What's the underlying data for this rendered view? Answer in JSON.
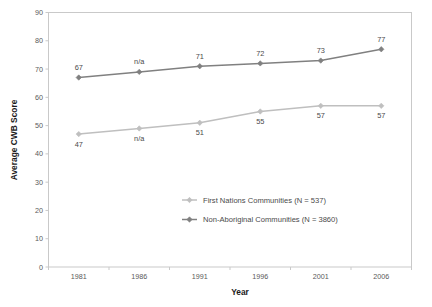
{
  "chart_data": {
    "type": "line",
    "title": "",
    "xlabel": "Year",
    "ylabel": "Average CWB Score",
    "x": [
      "1981",
      "1986",
      "1991",
      "1996",
      "2001",
      "2006"
    ],
    "categories": [
      "1981",
      "1986",
      "1991",
      "1996",
      "2001",
      "2006"
    ],
    "ylim": [
      0,
      90
    ],
    "yticks": [
      "0",
      "10",
      "20",
      "30",
      "40",
      "50",
      "60",
      "70",
      "80",
      "90"
    ],
    "grid": false,
    "legend_position": "inside-center-right",
    "series": [
      {
        "name": "First Nations Communities (N = 537)",
        "color": "#bfbfbf",
        "values": [
          47,
          49,
          51,
          55,
          57,
          57
        ],
        "labels": [
          "47",
          "n/a",
          "51",
          "55",
          "57",
          "57"
        ],
        "label_position": "below"
      },
      {
        "name": "Non-Aboriginal Communities (N = 3860)",
        "color": "#808080",
        "values": [
          67,
          69,
          71,
          72,
          73,
          77
        ],
        "labels": [
          "67",
          "n/a",
          "71",
          "72",
          "73",
          "77"
        ],
        "label_position": "above"
      }
    ]
  },
  "axes": {
    "y_title": "Average CWB Score",
    "x_title": "Year"
  },
  "legend": {
    "items": [
      {
        "label": "First Nations Communities (N = 537)"
      },
      {
        "label": "Non-Aboriginal Communities (N = 3860)"
      }
    ]
  },
  "colors": {
    "series_light": "#bfbfbf",
    "series_dark": "#808080",
    "border": "#c9c9c9",
    "text": "#4a4a4a"
  }
}
